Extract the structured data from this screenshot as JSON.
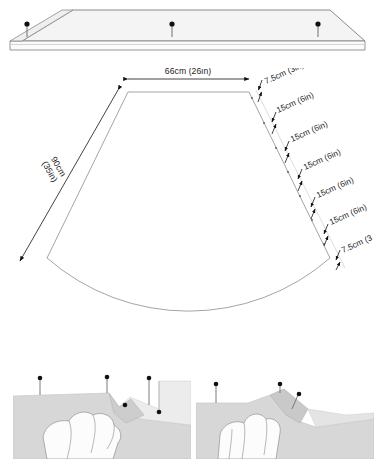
{
  "figure": {
    "type": "sewing-pattern-diagram"
  },
  "colors": {
    "outline": "#8a8a8a",
    "fabric_fill": "#f4f4f4",
    "fabric_shade": "#d7d7d7",
    "fabric_shade_dark": "#c9c9c9",
    "pin_head": "#111111",
    "pin_shaft": "#6e6e6e",
    "dimension_line": "#b9b9b9",
    "arrow": "#111111",
    "text": "#1a1a1a",
    "photo_bg": "#ffffff",
    "hand_fill": "#fcfcfc"
  },
  "waistband_panel": {
    "name": "waistband-strip",
    "pin_count": 3,
    "pins": [
      {
        "label": "pin-left"
      },
      {
        "label": "pin-center"
      },
      {
        "label": "pin-right"
      }
    ]
  },
  "skirt_panel": {
    "name": "skirt-pattern-piece",
    "shape": "trapezoid-with-curved-hem",
    "top_dimension": {
      "label": "66cm (26in)",
      "value_cm": 66,
      "value_in": 26,
      "arrow": "double-headed"
    },
    "side_dimension": {
      "label": "90cm\n(35in)",
      "line1": "90cm",
      "line2": "(35in)",
      "value_cm": 90,
      "value_in": 35,
      "arrow": "double-headed"
    },
    "segment_labels": [
      "7.5cm (3in)",
      "15cm (6in)",
      "15cm (6in)",
      "15cm (6in)",
      "15cm (6in)",
      "15cm (6in)",
      "7.5cm (3"
    ],
    "segments": [
      {
        "label": "7.5cm (3in)",
        "value_cm": 7.5,
        "value_in": 3
      },
      {
        "label": "15cm (6in)",
        "value_cm": 15,
        "value_in": 6
      },
      {
        "label": "15cm (6in)",
        "value_cm": 15,
        "value_in": 6
      },
      {
        "label": "15cm (6in)",
        "value_cm": 15,
        "value_in": 6
      },
      {
        "label": "15cm (6in)",
        "value_cm": 15,
        "value_in": 6
      },
      {
        "label": "15cm (6in)",
        "value_cm": 15,
        "value_in": 6
      },
      {
        "label": "7.5cm (3",
        "value_cm": 7.5,
        "value_in": 3,
        "clipped": true
      }
    ]
  },
  "photo_left": {
    "name": "step-photo-left",
    "description": "hand pinching fabric fold with pins",
    "pin_count": 5
  },
  "photo_right": {
    "name": "step-photo-right",
    "description": "hand pinching fabric pleat with pins",
    "pin_count": 3
  }
}
